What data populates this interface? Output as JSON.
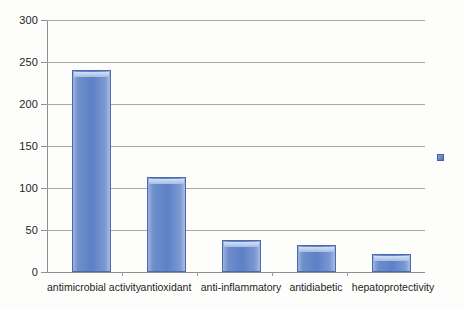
{
  "chart_data": {
    "type": "bar",
    "title": "",
    "subtitle": "",
    "xlabel": "",
    "ylabel": "",
    "categories": [
      "antimicrobial activity",
      "antioxidant",
      "anti-inflammatory",
      "antidiabetic",
      "hepatoprotectivity"
    ],
    "values": [
      240,
      113,
      38,
      32,
      21
    ],
    "ylim": [
      0,
      300
    ],
    "yticks": [
      0,
      50,
      100,
      150,
      200,
      250,
      300
    ],
    "ytick_labels": [
      "0",
      "50",
      "100",
      "150",
      "200",
      "250",
      "300"
    ],
    "grid": true,
    "legend": {
      "position": "right",
      "entries": [
        {
          "label": "",
          "color": "#5e80c6"
        }
      ]
    },
    "series": [
      {
        "name": "",
        "color": "#5e80c6",
        "values": [
          240,
          113,
          38,
          32,
          21
        ]
      }
    ]
  },
  "colors": {
    "bar_fill": "#5e80c6",
    "bar_border": "#4a6aad",
    "bar_highlight": "#d8e4f6",
    "gridline": "#a9a9a9",
    "axis": "#8f8f8f",
    "text": "#1f1f1f",
    "background": "#fdfdfb"
  }
}
